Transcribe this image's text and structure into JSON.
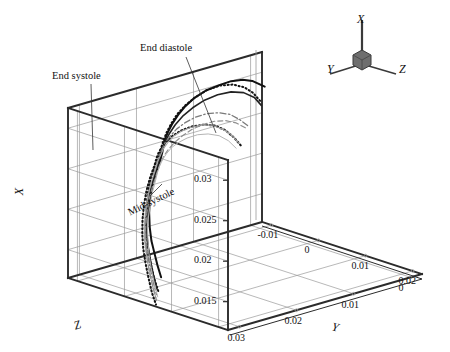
{
  "figure": {
    "type": "3d-line-plot",
    "background": "#ffffff",
    "ink": "#1a1a1a",
    "grid_color": "#9a9a9a",
    "box_color": "#2b2b2b"
  },
  "axes": {
    "x": {
      "label": "X",
      "ticks": [
        "0.03",
        "0.025",
        "0.02",
        "0.015"
      ],
      "values": [
        0.03,
        0.025,
        0.02,
        0.015
      ],
      "range": [
        0.0115,
        0.0325
      ]
    },
    "y": {
      "label": "Y",
      "ticks": [
        "0.03",
        "0.02",
        "0.01",
        "0"
      ],
      "values": [
        0.03,
        0.02,
        0.01,
        0.0
      ],
      "range": [
        0.032,
        -0.002
      ],
      "direction": "decreasing-left-to-right"
    },
    "z": {
      "label": "Z",
      "ticks": [
        "-0.01",
        "0",
        "0.01",
        "0.02"
      ],
      "values": [
        -0.01,
        0.0,
        0.01,
        0.02
      ],
      "range": [
        -0.012,
        0.022
      ]
    }
  },
  "orientation_widget": {
    "name": "axis-triad",
    "x_label": "X",
    "y_label": "Y",
    "z_label": "Z",
    "hub_color": "#6e6e6e"
  },
  "annotations": [
    {
      "id": "end-systole",
      "text": "End systole",
      "x": 52,
      "y": 70,
      "rotation": 0
    },
    {
      "id": "end-diastole",
      "text": "End diastole",
      "x": 140,
      "y": 42,
      "rotation": 0
    },
    {
      "id": "mid-systole",
      "text": "Mid-systole",
      "x": 126,
      "y": 196,
      "rotation": -26
    }
  ],
  "chart_data": {
    "type": "line",
    "title": "",
    "xlabel": "Z",
    "ylabel": "X",
    "zlabel": "Y",
    "legend": [
      "End systole",
      "End diastole",
      "Mid-systole"
    ],
    "series": [
      {
        "name": "end-diastole-upper",
        "style": "solid-thick",
        "color": "#111111",
        "width": 2.0,
        "points": [
          [
            0.0,
            0.0292
          ],
          [
            0.0012,
            0.0298
          ],
          [
            0.003,
            0.0307
          ],
          [
            0.0052,
            0.0314
          ],
          [
            0.0078,
            0.0319
          ],
          [
            0.0105,
            0.0321
          ],
          [
            0.0135,
            0.0322
          ],
          [
            0.0162,
            0.032
          ],
          [
            0.0185,
            0.0316
          ],
          [
            0.0205,
            0.0311
          ],
          [
            0.0222,
            0.0306
          ],
          [
            0.0238,
            0.03
          ],
          [
            0.0252,
            0.0294
          ],
          [
            0.0262,
            0.029
          ],
          [
            0.0272,
            0.0287
          ],
          [
            0.0284,
            0.0282
          ],
          [
            0.03,
            0.0272
          ],
          [
            0.0315,
            0.026
          ],
          [
            0.0328,
            0.0248
          ],
          [
            0.0338,
            0.0236
          ],
          [
            0.0346,
            0.0222
          ],
          [
            0.0352,
            0.0208
          ],
          [
            0.0356,
            0.0196
          ],
          [
            0.036,
            0.0184
          ],
          [
            0.0363,
            0.0172
          ]
        ]
      },
      {
        "name": "end-diastole-dotted",
        "style": "dotted-thick",
        "color": "#111111",
        "width": 2.0,
        "points": [
          [
            0.0008,
            0.0276
          ],
          [
            0.0024,
            0.029
          ],
          [
            0.0044,
            0.0302
          ],
          [
            0.007,
            0.0312
          ],
          [
            0.0098,
            0.0318
          ],
          [
            0.0128,
            0.032
          ],
          [
            0.0156,
            0.0318
          ],
          [
            0.018,
            0.0315
          ],
          [
            0.0202,
            0.031
          ],
          [
            0.022,
            0.0304
          ],
          [
            0.0236,
            0.0298
          ],
          [
            0.025,
            0.0292
          ],
          [
            0.0262,
            0.0288
          ],
          [
            0.0274,
            0.0284
          ],
          [
            0.029,
            0.0276
          ],
          [
            0.0306,
            0.0265
          ],
          [
            0.032,
            0.0252
          ],
          [
            0.0332,
            0.0239
          ],
          [
            0.0342,
            0.0224
          ],
          [
            0.035,
            0.021
          ],
          [
            0.0356,
            0.0196
          ],
          [
            0.0361,
            0.0182
          ],
          [
            0.0365,
            0.0168
          ],
          [
            0.0368,
            0.0156
          ]
        ]
      },
      {
        "name": "end-systole-solid",
        "style": "solid-medium",
        "color": "#222222",
        "width": 1.6,
        "points": [
          [
            0.0006,
            0.027
          ],
          [
            0.0022,
            0.0284
          ],
          [
            0.0046,
            0.0296
          ],
          [
            0.0074,
            0.0304
          ],
          [
            0.0104,
            0.0308
          ],
          [
            0.0134,
            0.0309
          ],
          [
            0.0162,
            0.0307
          ],
          [
            0.0186,
            0.0304
          ],
          [
            0.0208,
            0.0299
          ],
          [
            0.0226,
            0.0294
          ],
          [
            0.0242,
            0.0289
          ],
          [
            0.0256,
            0.0285
          ],
          [
            0.0268,
            0.0282
          ],
          [
            0.028,
            0.0277
          ],
          [
            0.0296,
            0.0268
          ],
          [
            0.0312,
            0.0256
          ],
          [
            0.0326,
            0.0243
          ],
          [
            0.0338,
            0.0229
          ],
          [
            0.0348,
            0.0214
          ],
          [
            0.0355,
            0.02
          ],
          [
            0.0361,
            0.0186
          ],
          [
            0.0366,
            0.0172
          ],
          [
            0.037,
            0.0158
          ]
        ]
      },
      {
        "name": "mid-systole-dotted",
        "style": "dotted-thick",
        "color": "#151515",
        "width": 2.1,
        "points": [
          [
            0.0042,
            0.0228
          ],
          [
            0.0058,
            0.0242
          ],
          [
            0.0078,
            0.0256
          ],
          [
            0.0102,
            0.0268
          ],
          [
            0.0128,
            0.0276
          ],
          [
            0.0156,
            0.0281
          ],
          [
            0.0182,
            0.0283
          ],
          [
            0.0204,
            0.0283
          ],
          [
            0.0224,
            0.0281
          ],
          [
            0.024,
            0.0279
          ],
          [
            0.0254,
            0.0277
          ],
          [
            0.0266,
            0.0275
          ],
          [
            0.0278,
            0.0271
          ],
          [
            0.0294,
            0.0263
          ],
          [
            0.031,
            0.0251
          ],
          [
            0.0324,
            0.0238
          ],
          [
            0.0336,
            0.0224
          ],
          [
            0.0346,
            0.021
          ],
          [
            0.0354,
            0.0196
          ],
          [
            0.036,
            0.0182
          ],
          [
            0.0365,
            0.0168
          ],
          [
            0.0369,
            0.0152
          ],
          [
            0.0372,
            0.014
          ]
        ]
      },
      {
        "name": "intermediate-dashdot",
        "style": "dash-dot",
        "color": "#7a7a7a",
        "width": 1.3,
        "points": [
          [
            0.003,
            0.025
          ],
          [
            0.0048,
            0.0262
          ],
          [
            0.007,
            0.0274
          ],
          [
            0.0096,
            0.0283
          ],
          [
            0.0124,
            0.0289
          ],
          [
            0.0152,
            0.0292
          ],
          [
            0.0178,
            0.0292
          ],
          [
            0.02,
            0.0291
          ],
          [
            0.022,
            0.0288
          ],
          [
            0.0238,
            0.0285
          ],
          [
            0.0252,
            0.0282
          ],
          [
            0.0266,
            0.0279
          ],
          [
            0.028,
            0.0273
          ],
          [
            0.0296,
            0.0264
          ],
          [
            0.0312,
            0.0252
          ],
          [
            0.0326,
            0.0239
          ],
          [
            0.0338,
            0.0225
          ],
          [
            0.0348,
            0.0211
          ],
          [
            0.0356,
            0.0196
          ],
          [
            0.0362,
            0.0182
          ],
          [
            0.0367,
            0.0167
          ],
          [
            0.0371,
            0.0152
          ]
        ]
      },
      {
        "name": "intermediate-grey-a",
        "style": "solid-thin",
        "color": "#a8a8a8",
        "width": 1.1,
        "points": [
          [
            0.0046,
            0.0232
          ],
          [
            0.0062,
            0.0246
          ],
          [
            0.0084,
            0.0259
          ],
          [
            0.0108,
            0.027
          ],
          [
            0.0134,
            0.0277
          ],
          [
            0.016,
            0.0281
          ],
          [
            0.0184,
            0.0283
          ],
          [
            0.0206,
            0.0283
          ],
          [
            0.0224,
            0.0281
          ],
          [
            0.024,
            0.0279
          ],
          [
            0.0254,
            0.0276
          ],
          [
            0.0268,
            0.0273
          ],
          [
            0.0282,
            0.0267
          ],
          [
            0.0298,
            0.0258
          ],
          [
            0.0314,
            0.0246
          ],
          [
            0.0328,
            0.0233
          ],
          [
            0.034,
            0.0219
          ],
          [
            0.035,
            0.0205
          ],
          [
            0.0357,
            0.0191
          ],
          [
            0.0363,
            0.0177
          ],
          [
            0.0368,
            0.0162
          ],
          [
            0.0372,
            0.0148
          ]
        ]
      },
      {
        "name": "intermediate-grey-b",
        "style": "dashed-thin",
        "color": "#8f8f8f",
        "width": 1.2,
        "points": [
          [
            0.0034,
            0.0248
          ],
          [
            0.0054,
            0.0259
          ],
          [
            0.0078,
            0.0268
          ],
          [
            0.0104,
            0.0274
          ],
          [
            0.0132,
            0.0277
          ],
          [
            0.0158,
            0.0278
          ],
          [
            0.0182,
            0.0277
          ],
          [
            0.0204,
            0.0275
          ],
          [
            0.0222,
            0.0273
          ],
          [
            0.0238,
            0.0271
          ],
          [
            0.0252,
            0.0269
          ],
          [
            0.0266,
            0.0266
          ],
          [
            0.028,
            0.0261
          ],
          [
            0.0296,
            0.0252
          ],
          [
            0.0312,
            0.0241
          ],
          [
            0.0326,
            0.0228
          ],
          [
            0.0338,
            0.0215
          ],
          [
            0.0348,
            0.0201
          ],
          [
            0.0356,
            0.0187
          ],
          [
            0.0362,
            0.0173
          ],
          [
            0.0367,
            0.0159
          ],
          [
            0.0371,
            0.0145
          ]
        ]
      },
      {
        "name": "lower-bundle-grey",
        "style": "solid-thin",
        "color": "#b5b5b5",
        "width": 1.0,
        "points": [
          [
            0.005,
            0.0226
          ],
          [
            0.0068,
            0.024
          ],
          [
            0.009,
            0.0252
          ],
          [
            0.0116,
            0.0261
          ],
          [
            0.0142,
            0.0267
          ],
          [
            0.0168,
            0.027
          ],
          [
            0.0192,
            0.0271
          ],
          [
            0.0212,
            0.0271
          ],
          [
            0.023,
            0.0269
          ],
          [
            0.0246,
            0.0267
          ],
          [
            0.026,
            0.0265
          ],
          [
            0.0274,
            0.0261
          ],
          [
            0.0288,
            0.0254
          ],
          [
            0.0304,
            0.0244
          ],
          [
            0.0318,
            0.0232
          ],
          [
            0.0332,
            0.0219
          ],
          [
            0.0342,
            0.0205
          ],
          [
            0.0351,
            0.0191
          ],
          [
            0.0358,
            0.0177
          ],
          [
            0.0364,
            0.0163
          ],
          [
            0.0369,
            0.0149
          ]
        ]
      }
    ]
  }
}
